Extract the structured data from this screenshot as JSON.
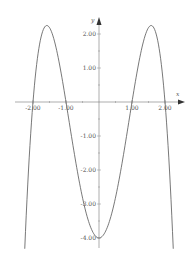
{
  "chart_data": {
    "type": "line",
    "title": "",
    "xlabel": "x",
    "ylabel": "y",
    "function": "f(x) = -x^4 + 5x^2 - 4",
    "xlim": [
      -2.5,
      2.5
    ],
    "ylim": [
      -4.3,
      2.5
    ],
    "grid": false,
    "legend": null,
    "x_ticks": [
      -2,
      -1,
      1,
      2
    ],
    "x_tick_labels": [
      "-2.00",
      "-1.00",
      "1.00",
      "2.00"
    ],
    "y_ticks": [
      2,
      1,
      -1,
      -2,
      -3,
      -4
    ],
    "y_tick_labels": [
      "2.00",
      "1.00",
      "-1.00",
      "-2.00",
      "-3.00",
      "-4.00"
    ],
    "key_points": {
      "roots": [
        -2,
        -1,
        1,
        2
      ],
      "local_maxima": [
        {
          "x": -1.58,
          "y": 2.25
        },
        {
          "x": 1.58,
          "y": 2.25
        }
      ],
      "local_minimum": {
        "x": 0,
        "y": -4
      }
    },
    "series": [
      {
        "name": "f(x)",
        "color": "#555555",
        "x": [
          -2.25,
          -2.2,
          -2.1,
          -2.0,
          -1.9,
          -1.8,
          -1.7,
          -1.58,
          -1.5,
          -1.4,
          -1.3,
          -1.2,
          -1.1,
          -1.0,
          -0.8,
          -0.6,
          -0.4,
          -0.2,
          0.0,
          0.2,
          0.4,
          0.6,
          0.8,
          1.0,
          1.1,
          1.2,
          1.3,
          1.4,
          1.5,
          1.58,
          1.7,
          1.8,
          1.9,
          2.0,
          2.1,
          2.2,
          2.25
        ],
        "values": [
          -4.32,
          -3.23,
          -1.4,
          0.0,
          0.99,
          1.7,
          2.1,
          2.25,
          2.19,
          1.96,
          1.6,
          1.13,
          0.59,
          0.0,
          -1.21,
          -2.33,
          -3.22,
          -3.8,
          -4.0,
          -3.8,
          -3.22,
          -2.33,
          -1.21,
          0.0,
          0.59,
          1.13,
          1.6,
          1.96,
          2.19,
          2.25,
          2.1,
          1.7,
          0.99,
          0.0,
          -1.4,
          -3.23,
          -4.32
        ]
      }
    ]
  },
  "axes": {
    "x_name": "x",
    "y_name": "y"
  },
  "colors": {
    "axis": "#555555",
    "curve": "#555555",
    "background": "#ffffff"
  }
}
